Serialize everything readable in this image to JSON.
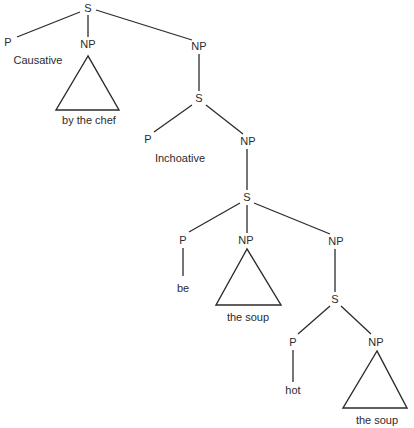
{
  "diagram": {
    "type": "syntax-tree",
    "colors": {
      "ink": "#2b2b2b",
      "background": "#ffffff"
    },
    "nodes": [
      {
        "id": "s1",
        "label": "S",
        "x": 88,
        "y": 12
      },
      {
        "id": "p1",
        "label": "P",
        "x": 8,
        "y": 46
      },
      {
        "id": "np1",
        "label": "NP",
        "x": 88,
        "y": 48
      },
      {
        "id": "np2",
        "label": "NP",
        "x": 199,
        "y": 50
      },
      {
        "id": "s2",
        "label": "S",
        "x": 199,
        "y": 102
      },
      {
        "id": "p2",
        "label": "P",
        "x": 148,
        "y": 143
      },
      {
        "id": "np3",
        "label": "NP",
        "x": 248,
        "y": 145
      },
      {
        "id": "s3",
        "label": "S",
        "x": 247,
        "y": 201
      },
      {
        "id": "p3",
        "label": "P",
        "x": 183,
        "y": 244
      },
      {
        "id": "np4",
        "label": "NP",
        "x": 246,
        "y": 244
      },
      {
        "id": "np5",
        "label": "NP",
        "x": 336,
        "y": 245
      },
      {
        "id": "s4",
        "label": "S",
        "x": 335,
        "y": 303
      },
      {
        "id": "p4",
        "label": "P",
        "x": 293,
        "y": 346
      },
      {
        "id": "np6",
        "label": "NP",
        "x": 376,
        "y": 346
      }
    ],
    "edges": [
      {
        "from": "s1",
        "to": "p1",
        "x1": 80,
        "y1": 12,
        "x2": 17,
        "y2": 37
      },
      {
        "from": "s1",
        "to": "np1",
        "x1": 88,
        "y1": 15,
        "x2": 88,
        "y2": 37
      },
      {
        "from": "s1",
        "to": "np2",
        "x1": 96,
        "y1": 10,
        "x2": 192,
        "y2": 40
      },
      {
        "from": "np2",
        "to": "s2",
        "x1": 199,
        "y1": 54,
        "x2": 199,
        "y2": 91
      },
      {
        "from": "s2",
        "to": "p2",
        "x1": 192,
        "y1": 105,
        "x2": 154,
        "y2": 132
      },
      {
        "from": "s2",
        "to": "np3",
        "x1": 206,
        "y1": 105,
        "x2": 243,
        "y2": 134
      },
      {
        "from": "np3",
        "to": "s3",
        "x1": 247,
        "y1": 149,
        "x2": 247,
        "y2": 190
      },
      {
        "from": "s3",
        "to": "p3",
        "x1": 240,
        "y1": 203,
        "x2": 189,
        "y2": 232
      },
      {
        "from": "s3",
        "to": "np4",
        "x1": 247,
        "y1": 205,
        "x2": 247,
        "y2": 233
      },
      {
        "from": "s3",
        "to": "np5",
        "x1": 254,
        "y1": 203,
        "x2": 330,
        "y2": 234
      },
      {
        "from": "p3",
        "to": "be",
        "x1": 183,
        "y1": 248,
        "x2": 183,
        "y2": 276
      },
      {
        "from": "np5",
        "to": "s4",
        "x1": 335,
        "y1": 249,
        "x2": 335,
        "y2": 292
      },
      {
        "from": "s4",
        "to": "p4",
        "x1": 330,
        "y1": 306,
        "x2": 298,
        "y2": 334
      },
      {
        "from": "s4",
        "to": "np6",
        "x1": 341,
        "y1": 306,
        "x2": 371,
        "y2": 334
      },
      {
        "from": "p4",
        "to": "hot",
        "x1": 293,
        "y1": 350,
        "x2": 293,
        "y2": 382
      }
    ],
    "triangles": [
      {
        "id": "tri1",
        "apex": [
          88,
          56
        ],
        "left": [
          56,
          110
        ],
        "right": [
          119,
          110
        ]
      },
      {
        "id": "tri2",
        "apex": [
          247,
          249
        ],
        "left": [
          216,
          305
        ],
        "right": [
          281,
          305
        ]
      },
      {
        "id": "tri3",
        "apex": [
          377,
          351
        ],
        "left": [
          343,
          408
        ],
        "right": [
          407,
          408
        ]
      }
    ],
    "terminals": [
      {
        "id": "causative",
        "text": "Causative",
        "x": 38,
        "y": 64
      },
      {
        "id": "by-the-chef",
        "text": "by the chef",
        "x": 89,
        "y": 124
      },
      {
        "id": "inchoative",
        "text": "Inchoative",
        "x": 180,
        "y": 162
      },
      {
        "id": "be",
        "text": "be",
        "x": 183,
        "y": 292
      },
      {
        "id": "the-soup-1",
        "text": "the soup",
        "x": 248,
        "y": 321
      },
      {
        "id": "hot",
        "text": "hot",
        "x": 293,
        "y": 394
      },
      {
        "id": "the-soup-2",
        "text": "the soup",
        "x": 377,
        "y": 424
      }
    ]
  }
}
